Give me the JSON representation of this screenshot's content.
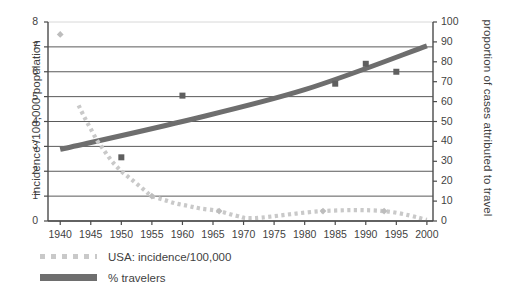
{
  "chart_data": {
    "type": "line",
    "title": "",
    "xlabel": "",
    "x_ticks": [
      1940,
      1945,
      1950,
      1955,
      1960,
      1965,
      1970,
      1975,
      1980,
      1985,
      1990,
      1995,
      2000
    ],
    "xlim": [
      1938,
      2001
    ],
    "grid": true,
    "legend_position": "bottom-left",
    "y_axes": {
      "left": {
        "label": "incidence /100,000 population",
        "ticks": [
          0,
          1,
          2,
          3,
          4,
          5,
          6,
          7,
          8
        ],
        "ylim": [
          0,
          8
        ]
      },
      "right": {
        "label": "proportion of cases attributed to travel",
        "ticks": [
          0,
          10,
          20,
          30,
          40,
          50,
          60,
          70,
          80,
          90,
          100
        ],
        "ylim": [
          0,
          100
        ]
      }
    },
    "series": [
      {
        "name": "USA: incidence/100,000",
        "axis": "left",
        "style": "dotted",
        "color": "#c9c9c9",
        "marker": "diamond",
        "points": [
          {
            "x": 1940,
            "y": 7.5,
            "marker": true
          },
          {
            "x": 1943,
            "y": 4.65
          },
          {
            "x": 1944,
            "y": 4.15
          },
          {
            "x": 1945,
            "y": 3.7
          },
          {
            "x": 1946,
            "y": 3.25
          },
          {
            "x": 1947,
            "y": 2.9
          },
          {
            "x": 1948,
            "y": 2.55
          },
          {
            "x": 1949,
            "y": 2.25
          },
          {
            "x": 1950,
            "y": 2.0
          },
          {
            "x": 1951,
            "y": 1.8
          },
          {
            "x": 1952,
            "y": 1.6
          },
          {
            "x": 1953,
            "y": 1.4
          },
          {
            "x": 1954,
            "y": 1.2
          },
          {
            "x": 1955,
            "y": 1.0,
            "marker": true
          },
          {
            "x": 1957,
            "y": 0.85
          },
          {
            "x": 1959,
            "y": 0.7
          },
          {
            "x": 1961,
            "y": 0.6
          },
          {
            "x": 1963,
            "y": 0.5
          },
          {
            "x": 1966,
            "y": 0.4,
            "marker": true
          },
          {
            "x": 1969,
            "y": 0.2
          },
          {
            "x": 1972,
            "y": 0.12
          },
          {
            "x": 1983,
            "y": 0.4,
            "marker": true
          },
          {
            "x": 1993,
            "y": 0.4,
            "marker": true
          },
          {
            "x": 2000,
            "y": 0.05
          }
        ]
      },
      {
        "name": "% travelers",
        "axis": "right",
        "style": "solid-thick",
        "color": "#6e6e6e",
        "marker": "square",
        "trend": [
          {
            "x": 1940,
            "y": 36
          },
          {
            "x": 1960,
            "y": 50
          },
          {
            "x": 1980,
            "y": 66
          },
          {
            "x": 2000,
            "y": 88
          }
        ],
        "points": [
          {
            "x": 1950,
            "y": 32
          },
          {
            "x": 1960,
            "y": 63
          },
          {
            "x": 1985,
            "y": 69
          },
          {
            "x": 1990,
            "y": 79
          },
          {
            "x": 1995,
            "y": 75
          }
        ]
      }
    ]
  },
  "legend": {
    "items": [
      {
        "label": "USA: incidence/100,000",
        "swatch": "dotted-light-gray"
      },
      {
        "label": "% travelers",
        "swatch": "solid-gray"
      }
    ]
  }
}
